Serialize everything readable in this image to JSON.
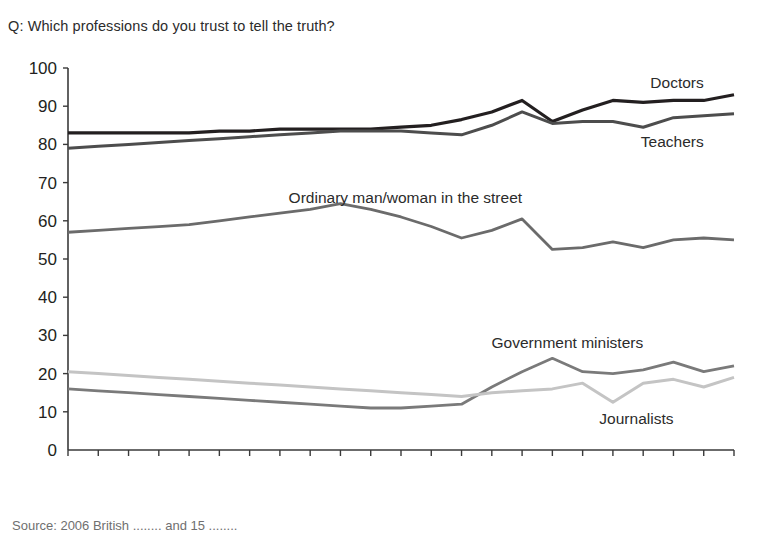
{
  "question": "Q: Which professions do you trust to tell the truth?",
  "source": "Source: 2006 British ........ and 15 ........",
  "axis": {
    "y_ticks": [
      0,
      10,
      20,
      30,
      40,
      50,
      60,
      70,
      80,
      90,
      100
    ],
    "x_ticks": [
      "1983",
      "1984",
      "1985",
      "1986",
      "1987",
      "1988",
      "1989",
      "1990",
      "1991",
      "1992",
      "1993",
      "1994",
      "1995",
      "1996",
      "1997",
      "1998",
      "1999",
      "2000",
      "2001",
      "2002",
      "2003",
      "2004",
      "2005"
    ]
  },
  "chart_data": {
    "type": "line",
    "title": "Q: Which professions do you trust to tell the truth?",
    "xlabel": "",
    "ylabel": "",
    "ylim": [
      0,
      100
    ],
    "grid": false,
    "legend": "inline-labels",
    "x": [
      "1983",
      "1984",
      "1985",
      "1986",
      "1987",
      "1988",
      "1989",
      "1990",
      "1991",
      "1992",
      "1993",
      "1994",
      "1995",
      "1996",
      "1997",
      "1998",
      "1999",
      "2000",
      "2001",
      "2002",
      "2003",
      "2004",
      "2005"
    ],
    "series": [
      {
        "name": "Doctors",
        "color": "#231f20",
        "width": 3.2,
        "label_x": 2004,
        "label_y": 96,
        "values": [
          83,
          83,
          83,
          83,
          83,
          83.5,
          83.5,
          84,
          84,
          84,
          84,
          84.5,
          85,
          86.5,
          88.5,
          91.5,
          86,
          89,
          91.5,
          91,
          91.5,
          91.5,
          93
        ]
      },
      {
        "name": "Teachers",
        "color": "#4d4d4d",
        "width": 3.0,
        "label_x": 2004,
        "label_y": 80.5,
        "values": [
          79,
          79.5,
          80,
          80.5,
          81,
          81.5,
          82,
          82.5,
          83,
          83.5,
          83.5,
          83.5,
          83,
          82.5,
          85,
          88.5,
          85.5,
          86,
          86,
          84.5,
          87,
          87.5,
          88
        ]
      },
      {
        "name": "Ordinary man/woman in the street",
        "color": "#6b6b6b",
        "width": 2.8,
        "label_x": 1998,
        "label_y": 66,
        "values": [
          57,
          57.5,
          58,
          58.5,
          59,
          60,
          61,
          62,
          63,
          64.5,
          63,
          61,
          58.5,
          55.5,
          57.5,
          60.5,
          52.5,
          53,
          54.5,
          53,
          55,
          55.5,
          55
        ]
      },
      {
        "name": "Government ministers",
        "color": "#7a7a7a",
        "width": 2.8,
        "label_x": 2002,
        "label_y": 28,
        "values": [
          16,
          15.5,
          15,
          14.5,
          14,
          13.5,
          13,
          12.5,
          12,
          11.5,
          11,
          11,
          11.5,
          12,
          16.5,
          20.5,
          24,
          20.5,
          20,
          21,
          23,
          20.5,
          22
        ]
      },
      {
        "name": "Journalists",
        "color": "#c4c4c4",
        "width": 3.0,
        "label_x": 2003,
        "label_y": 8,
        "values": [
          20.5,
          20,
          19.5,
          19,
          18.5,
          18,
          17.5,
          17,
          16.5,
          16,
          15.5,
          15,
          14.5,
          14,
          15,
          15.5,
          16,
          17.5,
          12.5,
          17.5,
          18.5,
          16.5,
          19
        ]
      }
    ]
  }
}
